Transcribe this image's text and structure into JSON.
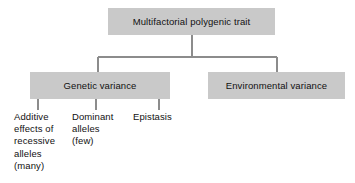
{
  "diagram": {
    "type": "hierarchy-tree",
    "background_color": "#ffffff",
    "box_fill_color": "#c9c9c9",
    "text_color": "#111111",
    "connector_color": "#8c8c8c",
    "root": {
      "label": "Multifactorial polygenic trait"
    },
    "level2": {
      "genetic": {
        "label": "Genetic variance"
      },
      "environmental": {
        "label": "Environmental variance"
      }
    },
    "level3": {
      "additive": {
        "line1": "Additive",
        "line2": "effects of",
        "line3": "recessive",
        "line4": "alleles",
        "line5": "(many)",
        "full_text": "Additive effects of recessive alleles (many)"
      },
      "dominant": {
        "line1": "Dominant",
        "line2": "alleles",
        "line3": "(few)",
        "full_text": "Dominant alleles (few)"
      },
      "epistasis": {
        "line1": "Epistasis",
        "full_text": "Epistasis"
      }
    }
  }
}
